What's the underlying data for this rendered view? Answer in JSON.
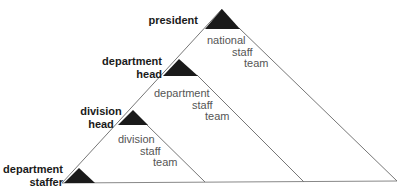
{
  "diagram": {
    "type": "hierarchical-pyramid",
    "colors": {
      "line": "#777777",
      "marker": "#1a1a1a",
      "team_text": "#555555",
      "role_text": "#1a1a1a"
    },
    "roles": [
      {
        "id": "president",
        "line1": "president",
        "line2": ""
      },
      {
        "id": "department-head",
        "line1": "department",
        "line2": "head"
      },
      {
        "id": "division-head",
        "line1": "division",
        "line2": "head"
      },
      {
        "id": "department-staffer",
        "line1": "department",
        "line2": "staffer"
      }
    ],
    "teams": [
      {
        "id": "national",
        "words": [
          "national",
          "staff",
          "team"
        ]
      },
      {
        "id": "department",
        "words": [
          "department",
          "staff",
          "team"
        ]
      },
      {
        "id": "division",
        "words": [
          "division",
          "staff",
          "team"
        ]
      }
    ]
  }
}
